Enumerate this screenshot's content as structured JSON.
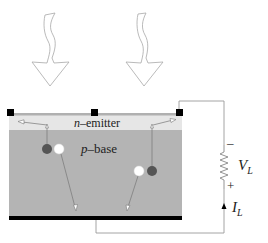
{
  "diagram": {
    "light_arrows": [
      {
        "name": "incident-light-left",
        "x": 50
      },
      {
        "name": "incident-light-right",
        "x": 145
      }
    ],
    "layers": {
      "emitter": {
        "label_italic": "n",
        "label_rest": "–emitter",
        "color": "#e6e6e6"
      },
      "base": {
        "label_italic": "p",
        "label_rest": "–base",
        "color": "#b4b4b4"
      },
      "back_contact_color": "#000000"
    },
    "carriers": {
      "electron_color": "#555555",
      "hole_color": "#ffffff"
    },
    "load": {
      "voltage_symbol": "V",
      "voltage_subscript": "L",
      "minus_sign": "–",
      "plus_sign": "+",
      "current_symbol": "I",
      "current_subscript": "L"
    },
    "colors": {
      "wire": "#9a9a9a",
      "arrow_outline": "#a0a0a0",
      "contact": "#000000"
    }
  }
}
